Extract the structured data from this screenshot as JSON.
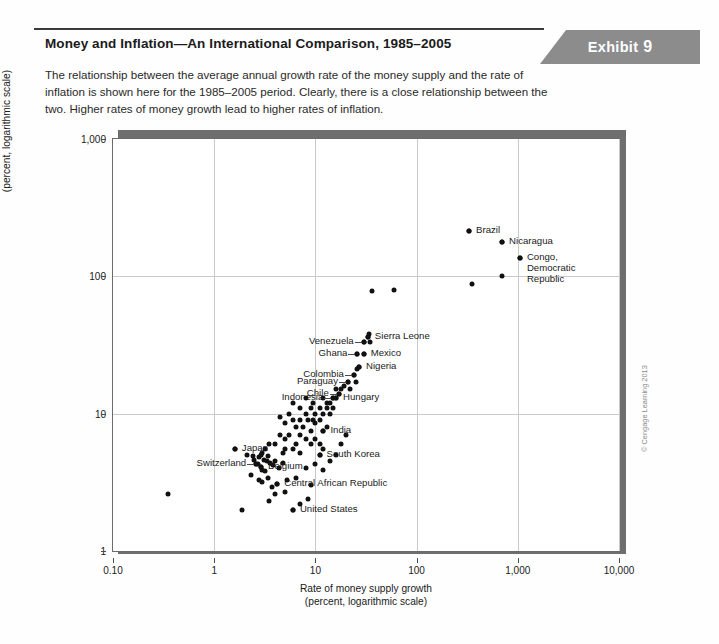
{
  "exhibit": {
    "label": "Exhibit",
    "number": "9"
  },
  "header": {
    "title": "Money and Inflation—An International Comparison, 1985–2005",
    "description": "The relationship between the average annual growth rate of the money supply and the rate of inflation is shown here for the 1985–2005 period. Clearly, there is a close relationship between the two. Higher rates of money growth lead to higher rates of inflation."
  },
  "credit": "© Cengage Learning 2013",
  "chart_data": {
    "type": "scatter",
    "title": "Money and Inflation—An International Comparison, 1985–2005",
    "xlabel": "Rate of money supply growth\n(percent, logarithmic scale)",
    "xlabel_line1": "Rate of money supply growth",
    "xlabel_line2": "(percent, logarithmic scale)",
    "ylabel_line1": "Rate of inflation per year",
    "ylabel_line2": "(percent, logarithmic scale)",
    "xscale": "log",
    "yscale": "log",
    "xlim": [
      0.1,
      10000
    ],
    "ylim": [
      1,
      1000
    ],
    "grid": true,
    "legend": "none",
    "xticks": [
      "0.10",
      "1",
      "10",
      "100",
      "1,000",
      "10,000"
    ],
    "xtickvalues": [
      0.1,
      1,
      10,
      100,
      1000,
      10000
    ],
    "yticks": [
      "1",
      "10",
      "100",
      "1,000"
    ],
    "ytickvalues": [
      1,
      10,
      100,
      1000
    ],
    "labeled_points": [
      {
        "name": "Brazil",
        "x": 330,
        "y": 215,
        "label_side": "right"
      },
      {
        "name": "Nicaragua",
        "x": 700,
        "y": 178,
        "label_side": "right"
      },
      {
        "name": "Congo,\nDemocratic\nRepublic",
        "x": 1050,
        "y": 135,
        "label_side": "right"
      },
      {
        "name": "Sierra Leone",
        "x": 33,
        "y": 36,
        "label_side": "right"
      },
      {
        "name": "Mexico",
        "x": 30,
        "y": 27,
        "label_side": "right"
      },
      {
        "name": "Nigeria",
        "x": 27,
        "y": 22,
        "label_side": "right"
      },
      {
        "name": "Venezuela",
        "x": 30,
        "y": 33,
        "label_side": "left"
      },
      {
        "name": "Ghana",
        "x": 26,
        "y": 27,
        "label_side": "left"
      },
      {
        "name": "Colombia",
        "x": 24,
        "y": 19,
        "label_side": "left"
      },
      {
        "name": "Paraguay",
        "x": 21,
        "y": 17,
        "label_side": "left"
      },
      {
        "name": "Chile",
        "x": 17,
        "y": 14,
        "label_side": "left"
      },
      {
        "name": "Indonesia",
        "x": 15,
        "y": 13,
        "label_side": "left"
      },
      {
        "name": "Hungary",
        "x": 16,
        "y": 13,
        "label_side": "right"
      },
      {
        "name": "India",
        "x": 12,
        "y": 7.5,
        "label_side": "right"
      },
      {
        "name": "South Korea",
        "x": 11,
        "y": 5.0,
        "label_side": "right"
      },
      {
        "name": "Japan",
        "x": 1.6,
        "y": 5.5,
        "label_side": "right"
      },
      {
        "name": "Switzerland",
        "x": 2.6,
        "y": 4.3,
        "label_side": "left"
      },
      {
        "name": "Belgium",
        "x": 2.9,
        "y": 4.1,
        "label_side": "right"
      },
      {
        "name": "Central African Republic",
        "x": 4.2,
        "y": 3.1,
        "label_side": "right"
      },
      {
        "name": "United States",
        "x": 6.0,
        "y": 2.0,
        "label_side": "right"
      }
    ],
    "points": [
      [
        330,
        215
      ],
      [
        700,
        178
      ],
      [
        1050,
        135
      ],
      [
        350,
        88
      ],
      [
        700,
        100
      ],
      [
        36,
        78
      ],
      [
        60,
        80
      ],
      [
        33,
        36
      ],
      [
        34,
        38
      ],
      [
        35,
        33
      ],
      [
        30,
        33
      ],
      [
        30,
        27
      ],
      [
        26,
        27
      ],
      [
        27,
        22
      ],
      [
        26,
        21
      ],
      [
        24,
        19
      ],
      [
        25,
        17
      ],
      [
        21,
        17
      ],
      [
        22,
        15
      ],
      [
        19,
        16
      ],
      [
        17,
        14
      ],
      [
        18,
        15
      ],
      [
        15,
        13
      ],
      [
        16,
        13
      ],
      [
        16,
        15
      ],
      [
        14,
        12
      ],
      [
        13,
        12
      ],
      [
        15,
        11
      ],
      [
        13,
        11
      ],
      [
        12,
        13
      ],
      [
        14,
        10
      ],
      [
        12,
        10
      ],
      [
        11,
        11
      ],
      [
        11,
        9
      ],
      [
        10,
        10
      ],
      [
        10,
        8.5
      ],
      [
        9.5,
        9
      ],
      [
        9,
        11
      ],
      [
        8.5,
        9
      ],
      [
        8,
        10
      ],
      [
        9,
        7.5
      ],
      [
        12,
        7.5
      ],
      [
        13,
        8
      ],
      [
        7.5,
        8
      ],
      [
        7,
        9
      ],
      [
        6.5,
        8
      ],
      [
        6,
        9
      ],
      [
        5.5,
        7
      ],
      [
        7,
        7
      ],
      [
        8,
        6.5
      ],
      [
        9,
        6
      ],
      [
        10,
        6.5
      ],
      [
        11,
        6
      ],
      [
        12,
        5.5
      ],
      [
        11,
        5.0
      ],
      [
        5,
        6.5
      ],
      [
        4.5,
        7
      ],
      [
        4,
        6
      ],
      [
        5,
        5.5
      ],
      [
        6,
        5.5
      ],
      [
        7,
        5.2
      ],
      [
        3.5,
        6
      ],
      [
        3.2,
        5.5
      ],
      [
        3,
        5.2
      ],
      [
        2.9,
        5.0
      ],
      [
        2.8,
        4.8
      ],
      [
        3.1,
        4.6
      ],
      [
        3.3,
        4.5
      ],
      [
        2.9,
        4.1
      ],
      [
        2.7,
        4.3
      ],
      [
        2.6,
        4.3
      ],
      [
        3.0,
        3.9
      ],
      [
        3.2,
        3.8
      ],
      [
        2.5,
        4.6
      ],
      [
        2.4,
        4.9
      ],
      [
        3.4,
        4.9
      ],
      [
        3.6,
        4.4
      ],
      [
        3.8,
        4.2
      ],
      [
        4.0,
        4.5
      ],
      [
        4.4,
        4.0
      ],
      [
        4.8,
        4.4
      ],
      [
        1.6,
        5.5
      ],
      [
        2.1,
        5.0
      ],
      [
        2.3,
        3.6
      ],
      [
        2.8,
        3.3
      ],
      [
        3.0,
        3.2
      ],
      [
        3.4,
        3.4
      ],
      [
        4.2,
        3.1
      ],
      [
        5.2,
        3.3
      ],
      [
        6.5,
        3.4
      ],
      [
        5.0,
        2.7
      ],
      [
        4.0,
        2.6
      ],
      [
        0.35,
        2.6
      ],
      [
        1.9,
        2.0
      ],
      [
        3.5,
        2.3
      ],
      [
        6.0,
        2.0
      ],
      [
        7.0,
        2.2
      ],
      [
        8.5,
        2.4
      ],
      [
        9.0,
        3.0
      ],
      [
        8.0,
        4.0
      ],
      [
        10,
        4.3
      ],
      [
        14,
        4.5
      ],
      [
        12,
        3.9
      ],
      [
        16,
        5.0
      ],
      [
        18,
        6.0
      ],
      [
        20,
        7.0
      ],
      [
        9.5,
        12
      ],
      [
        8.0,
        13
      ],
      [
        7.0,
        11
      ],
      [
        6.0,
        12
      ],
      [
        5.5,
        10
      ],
      [
        4.5,
        9.5
      ],
      [
        5.0,
        8.5
      ],
      [
        6.5,
        6.0
      ],
      [
        4.8,
        5.2
      ],
      [
        3.7,
        2.9
      ]
    ]
  }
}
